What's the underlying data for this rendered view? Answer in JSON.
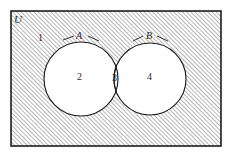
{
  "diagram": {
    "type": "venn",
    "title_symbol": "ℳ",
    "universe": {
      "symbol": "U",
      "label": "U",
      "position": {
        "x": 15,
        "y": 14
      },
      "description": "universal-set-symbol"
    },
    "frame": {
      "x": 11,
      "y": 11,
      "width": 210,
      "height": 135,
      "stroke": "#1c1c1c",
      "fill_pattern": "diagonal-hatch",
      "hatch_color": "#555555",
      "hatch_spacing": 3,
      "hatch_direction": "forward-slash"
    },
    "sets": [
      {
        "name": "A",
        "label": "A",
        "cx": 81,
        "cy": 79,
        "r": 37,
        "label_x": 80,
        "label_y": 36,
        "fill": "#ffffff",
        "stroke": "#1c1c1c",
        "leader": true
      },
      {
        "name": "B",
        "label": "B",
        "cx": 150,
        "cy": 79,
        "r": 36,
        "label_x": 149,
        "label_y": 36,
        "fill": "#ffffff",
        "stroke": "#1c1c1c",
        "leader": true
      }
    ],
    "regions": [
      {
        "id": "region-1",
        "label": "1",
        "meaning": "outside-both-sets",
        "x": 40,
        "y": 38,
        "shaded": true
      },
      {
        "id": "region-2",
        "label": "2",
        "meaning": "A-only",
        "x": 80,
        "y": 77,
        "shaded": false
      },
      {
        "id": "region-3",
        "label": "3",
        "meaning": "A-intersect-B",
        "x": 115,
        "y": 78,
        "shaded": false
      },
      {
        "id": "region-4",
        "label": "4",
        "meaning": "B-only",
        "x": 150,
        "y": 77,
        "shaded": false
      }
    ]
  }
}
